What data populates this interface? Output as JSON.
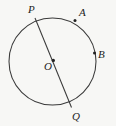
{
  "figure": {
    "type": "circle-diagram",
    "background_color": "#f7f7f5",
    "stroke_color": "#3a3a3a",
    "label_color": "#232323",
    "circle": {
      "center_x": 52.5,
      "center_y": 61.5,
      "radius": 43.5
    },
    "diameter": {
      "name": "PQ",
      "from": {
        "label": "P",
        "x": 35,
        "y": 18
      },
      "to": {
        "label": "Q",
        "x": 71.5,
        "y": 107.5
      }
    },
    "points": [
      {
        "label": "P",
        "x": 35,
        "y": 18,
        "dot": false,
        "label_x": 28,
        "label_y": 4
      },
      {
        "label": "A",
        "x": 75,
        "y": 20.5,
        "dot": true,
        "label_x": 79,
        "label_y": 7
      },
      {
        "label": "B",
        "x": 94.5,
        "y": 53,
        "dot": true,
        "label_x": 98,
        "label_y": 49
      },
      {
        "label": "O",
        "x": 52.5,
        "y": 61.5,
        "dot": true,
        "label_x": 44,
        "label_y": 61
      },
      {
        "label": "Q",
        "x": 71.5,
        "y": 107.5,
        "dot": false,
        "label_x": 72,
        "label_y": 111
      }
    ],
    "labels": {
      "point_p": "P",
      "point_a": "A",
      "point_b": "B",
      "center_o": "O",
      "point_q": "Q"
    }
  }
}
